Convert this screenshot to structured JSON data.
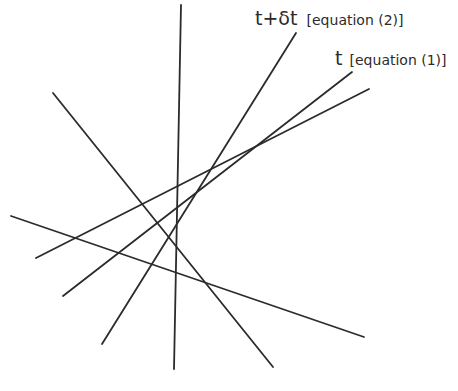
{
  "figure": {
    "labels": {
      "line_t_plus_dt": {
        "symbol": "t+δt",
        "annotation": "[equation (2)]",
        "x": 255,
        "y": 22
      },
      "line_t": {
        "symbol": "t",
        "annotation": "[equation (1)]",
        "x": 335,
        "y": 62
      }
    },
    "lines": [
      {
        "id": "vertical",
        "x1": 181,
        "y1": 5,
        "x2": 174,
        "y2": 369
      },
      {
        "id": "diagonal-down",
        "x1": 53,
        "y1": 93,
        "x2": 273,
        "y2": 367
      },
      {
        "id": "shallow-down",
        "x1": 11,
        "y1": 216,
        "x2": 364,
        "y2": 337
      },
      {
        "id": "t-plus-dt",
        "x1": 296,
        "y1": 33,
        "x2": 102,
        "y2": 344
      },
      {
        "id": "t",
        "x1": 352,
        "y1": 72,
        "x2": 63,
        "y2": 296
      },
      {
        "id": "third-rising",
        "x1": 369,
        "y1": 89,
        "x2": 36,
        "y2": 258
      }
    ],
    "colors": {
      "line": "#2b2b2b",
      "background": "#ffffff"
    }
  }
}
